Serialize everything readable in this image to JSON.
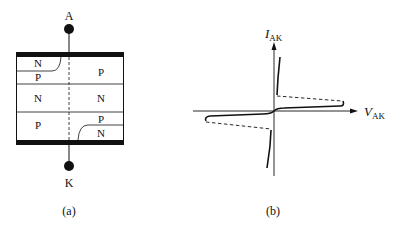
{
  "panel_a": {
    "caption": "(a)",
    "anode_label": "A",
    "cathode_label": "K",
    "layers": [
      {
        "left": "N",
        "right": "P",
        "left_sub": "P"
      },
      {
        "left": "N",
        "right": "N"
      },
      {
        "left": "P",
        "right": "P",
        "right_sub": "N"
      }
    ],
    "regions": {
      "top_left_n": "N",
      "top_left_p": "P",
      "top_right_p": "P",
      "mid_left_n": "N",
      "mid_right_n": "N",
      "bot_left_p": "P",
      "bot_right_p": "P",
      "bot_right_n": "N"
    }
  },
  "panel_b": {
    "caption": "(b)",
    "y_axis_label_main": "I",
    "y_axis_label_sub": "AK",
    "x_axis_label_main": "V",
    "x_axis_label_sub": "AK"
  },
  "colors": {
    "ink": "#111111",
    "background": "#ffffff"
  }
}
